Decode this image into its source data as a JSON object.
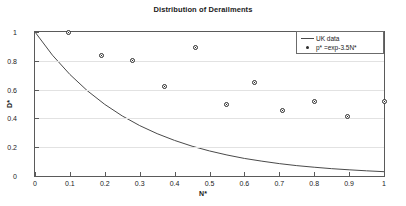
{
  "chart_data": {
    "type": "scatter",
    "title": "Distribution of Derailments",
    "xlabel": "N*",
    "ylabel": "D*",
    "xlim": [
      0,
      1
    ],
    "ylim": [
      0,
      1
    ],
    "grid": true,
    "legend_position": "top-right",
    "xticks": [
      "0",
      "0.1",
      "0.2",
      "0.3",
      "0.4",
      "0.5",
      "0.6",
      "0.7",
      "0.8",
      "0.9",
      "1"
    ],
    "xtick_values": [
      0,
      0.1,
      0.2,
      0.3,
      0.4,
      0.5,
      0.6,
      0.7,
      0.8,
      0.9,
      1
    ],
    "yticks": [
      "0",
      "0.2",
      "0.4",
      "0.6",
      "0.8",
      "1"
    ],
    "ytick_values": [
      0,
      0.2,
      0.4,
      0.6,
      0.8,
      1
    ],
    "series": [
      {
        "name": "UK data",
        "kind": "line",
        "color": "#4a4a4a",
        "x": [
          0,
          0.05,
          0.1,
          0.15,
          0.2,
          0.25,
          0.3,
          0.35,
          0.4,
          0.45,
          0.5,
          0.55,
          0.6,
          0.65,
          0.7,
          0.75,
          0.8,
          0.85,
          0.9,
          0.95,
          1
        ],
        "y": [
          1,
          0.839,
          0.705,
          0.592,
          0.497,
          0.417,
          0.35,
          0.294,
          0.247,
          0.207,
          0.174,
          0.146,
          0.122,
          0.103,
          0.086,
          0.072,
          0.061,
          0.051,
          0.043,
          0.036,
          0.03
        ]
      },
      {
        "name": "p* =exp-3.5N*",
        "kind": "scatter",
        "color": "#2b2b2b",
        "x": [
          0.095,
          0.19,
          0.28,
          0.37,
          0.46,
          0.55,
          0.63,
          0.71,
          0.8,
          0.895,
          1.0
        ],
        "y": [
          1.0,
          0.835,
          0.8,
          0.625,
          0.89,
          0.495,
          0.65,
          0.455,
          0.52,
          0.41,
          0.52
        ]
      }
    ]
  },
  "legend": {
    "entries": [
      {
        "label": "UK data",
        "marker": "line-sample"
      },
      {
        "label": "p* =exp-3.5N*",
        "marker": "dot-sample"
      }
    ]
  }
}
